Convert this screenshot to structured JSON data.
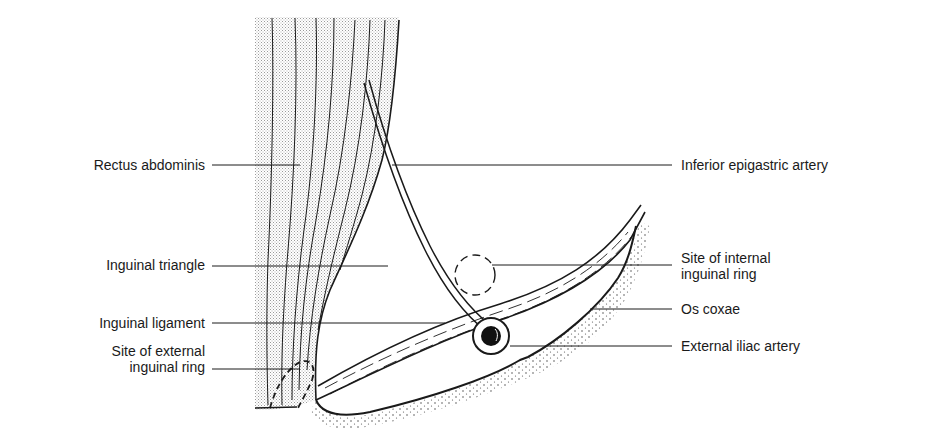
{
  "diagram": {
    "colors": {
      "ink": "#1a1a1a",
      "muscle_fill": "#d6d6d6",
      "background": "#ffffff"
    },
    "labels_left": [
      {
        "id": "rectus-abdominis",
        "lines": [
          "Rectus  abdominis"
        ]
      },
      {
        "id": "inguinal-triangle",
        "lines": [
          "Inguinal triangle"
        ]
      },
      {
        "id": "inguinal-ligament",
        "lines": [
          "Inguinal ligament"
        ]
      },
      {
        "id": "external-inguinal-ring",
        "lines": [
          "Site of external",
          "inguinal ring"
        ]
      }
    ],
    "labels_right": [
      {
        "id": "inferior-epigastric-artery",
        "lines": [
          "Inferior epigastric artery"
        ]
      },
      {
        "id": "internal-inguinal-ring",
        "lines": [
          "Site of internal",
          "inguinal ring"
        ]
      },
      {
        "id": "os-coxae",
        "lines": [
          "Os coxae"
        ]
      },
      {
        "id": "external-iliac-artery",
        "lines": [
          "External iliac artery"
        ]
      }
    ]
  }
}
